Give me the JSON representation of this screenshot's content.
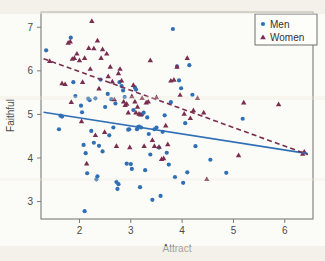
{
  "figure": {
    "background_color": "#fbfbf7",
    "frame_color": "#7b7b7b"
  },
  "legend": {
    "position": "top-right",
    "border_color": "#6f6f6f",
    "entries": [
      {
        "label": "Men",
        "marker": "circle",
        "color": "#2f6fb5"
      },
      {
        "label": "Women",
        "marker": "triangle",
        "color": "#7b2d50"
      }
    ]
  },
  "chart_data": {
    "type": "scatter",
    "title": "",
    "xlabel": "Attract",
    "ylabel": "Faithful",
    "xlim": [
      1.25,
      6.55
    ],
    "ylim": [
      2.6,
      7.35
    ],
    "xticks": [
      2,
      3,
      4,
      5,
      6
    ],
    "yticks": [
      3,
      4,
      5,
      6,
      7
    ],
    "grid": false,
    "legend_position": "top-right",
    "series": [
      {
        "name": "Men",
        "marker": "circle",
        "color": "#2f6fb5",
        "points": [
          [
            1.35,
            6.47
          ],
          [
            1.6,
            4.66
          ],
          [
            1.63,
            4.97
          ],
          [
            1.66,
            4.95
          ],
          [
            1.83,
            6.76
          ],
          [
            1.88,
            5.74
          ],
          [
            1.92,
            5.42
          ],
          [
            2.03,
            5.2
          ],
          [
            2.05,
            5.05
          ],
          [
            2.08,
            4.3
          ],
          [
            2.1,
            2.78
          ],
          [
            2.12,
            4.11
          ],
          [
            2.15,
            3.65
          ],
          [
            2.17,
            5.36
          ],
          [
            2.2,
            5.33
          ],
          [
            2.23,
            4.62
          ],
          [
            2.28,
            4.35
          ],
          [
            2.31,
            5.37
          ],
          [
            2.33,
            3.51
          ],
          [
            2.35,
            3.58
          ],
          [
            2.38,
            4.28
          ],
          [
            2.41,
            5.8
          ],
          [
            2.45,
            4.15
          ],
          [
            2.5,
            5.17
          ],
          [
            2.55,
            5.47
          ],
          [
            2.58,
            4.52
          ],
          [
            2.62,
            5.35
          ],
          [
            2.66,
            4.7
          ],
          [
            2.7,
            5.25
          ],
          [
            2.72,
            3.45
          ],
          [
            2.74,
            3.29
          ],
          [
            2.76,
            3.4
          ],
          [
            2.78,
            5.74
          ],
          [
            2.82,
            5.65
          ],
          [
            2.85,
            5.55
          ],
          [
            2.88,
            5.4
          ],
          [
            2.92,
            3.87
          ],
          [
            2.95,
            4.65
          ],
          [
            2.97,
            4.66
          ],
          [
            3.0,
            3.86
          ],
          [
            3.02,
            3.75
          ],
          [
            3.05,
            5.1
          ],
          [
            3.08,
            5.62
          ],
          [
            3.1,
            5.57
          ],
          [
            3.12,
            4.66
          ],
          [
            3.14,
            4.71
          ],
          [
            3.16,
            4.72
          ],
          [
            3.18,
            3.33
          ],
          [
            3.2,
            4.7
          ],
          [
            3.22,
            5.0
          ],
          [
            3.25,
            5.04
          ],
          [
            3.28,
            3.72
          ],
          [
            3.32,
            4.93
          ],
          [
            3.35,
            4.55
          ],
          [
            3.38,
            4.08
          ],
          [
            3.42,
            3.04
          ],
          [
            3.46,
            4.66
          ],
          [
            3.5,
            4.7
          ],
          [
            3.55,
            4.24
          ],
          [
            3.58,
            3.13
          ],
          [
            3.62,
            4.6
          ],
          [
            3.66,
            4.98
          ],
          [
            3.7,
            4.12
          ],
          [
            3.74,
            3.85
          ],
          [
            3.78,
            5.28
          ],
          [
            3.82,
            6.96
          ],
          [
            3.86,
            3.56
          ],
          [
            3.9,
            6.1
          ],
          [
            3.94,
            5.78
          ],
          [
            3.98,
            5.6
          ],
          [
            4.02,
            3.43
          ],
          [
            4.06,
            4.8
          ],
          [
            4.1,
            3.67
          ],
          [
            4.14,
            6.13
          ],
          [
            4.2,
            5.45
          ],
          [
            4.26,
            4.27
          ],
          [
            4.55,
            3.96
          ],
          [
            4.86,
            3.66
          ],
          [
            5.18,
            4.9
          ]
        ]
      },
      {
        "name": "Women",
        "marker": "triangle",
        "color": "#7b2d50",
        "points": [
          [
            1.42,
            6.23
          ],
          [
            1.66,
            5.72
          ],
          [
            1.72,
            5.7
          ],
          [
            1.78,
            6.65
          ],
          [
            1.82,
            6.68
          ],
          [
            1.84,
            5.29
          ],
          [
            1.86,
            6.28
          ],
          [
            1.9,
            6.3
          ],
          [
            1.95,
            6.4
          ],
          [
            2.0,
            6.25
          ],
          [
            2.04,
            4.85
          ],
          [
            2.06,
            5.75
          ],
          [
            2.1,
            6.3
          ],
          [
            2.14,
            3.88
          ],
          [
            2.18,
            6.53
          ],
          [
            2.21,
            6.05
          ],
          [
            2.24,
            7.15
          ],
          [
            2.28,
            6.52
          ],
          [
            2.31,
            4.53
          ],
          [
            2.35,
            6.7
          ],
          [
            2.38,
            5.6
          ],
          [
            2.42,
            6.3
          ],
          [
            2.45,
            6.5
          ],
          [
            2.49,
            4.6
          ],
          [
            2.53,
            6.4
          ],
          [
            2.56,
            5.88
          ],
          [
            2.6,
            6.1
          ],
          [
            2.64,
            5.76
          ],
          [
            2.68,
            5.35
          ],
          [
            2.72,
            4.28
          ],
          [
            2.76,
            5.95
          ],
          [
            2.79,
            6.05
          ],
          [
            2.82,
            5.78
          ],
          [
            2.86,
            5.3
          ],
          [
            2.89,
            5.22
          ],
          [
            2.92,
            5.25
          ],
          [
            2.95,
            5.05
          ],
          [
            2.98,
            4.25
          ],
          [
            3.02,
            5.42
          ],
          [
            3.05,
            5.68
          ],
          [
            3.08,
            5.3
          ],
          [
            3.1,
            5.05
          ],
          [
            3.13,
            5.18
          ],
          [
            3.16,
            5.02
          ],
          [
            3.19,
            5.0
          ],
          [
            3.22,
            5.38
          ],
          [
            3.26,
            4.28
          ],
          [
            3.3,
            5.28
          ],
          [
            3.34,
            5.3
          ],
          [
            3.38,
            6.25
          ],
          [
            3.42,
            4.42
          ],
          [
            3.46,
            4.28
          ],
          [
            3.5,
            5.4
          ],
          [
            3.55,
            4.26
          ],
          [
            3.6,
            3.98
          ],
          [
            3.64,
            4.0
          ],
          [
            3.68,
            4.75
          ],
          [
            3.72,
            4.32
          ],
          [
            3.78,
            5.78
          ],
          [
            3.84,
            5.8
          ],
          [
            3.9,
            6.1
          ],
          [
            3.96,
            5.45
          ],
          [
            4.04,
            5.02
          ],
          [
            4.1,
            6.3
          ],
          [
            4.16,
            4.92
          ],
          [
            4.22,
            5.1
          ],
          [
            4.3,
            5.38
          ],
          [
            4.42,
            5.05
          ],
          [
            4.48,
            3.52
          ],
          [
            5.1,
            4.07
          ],
          [
            5.2,
            5.28
          ],
          [
            5.88,
            5.24
          ],
          [
            6.35,
            4.1
          ],
          [
            6.38,
            4.15
          ]
        ]
      }
    ],
    "fit_lines": [
      {
        "name": "Men fit",
        "style": "solid",
        "color": "#2f6fb5",
        "x": [
          1.3,
          6.45
        ],
        "y": [
          5.05,
          4.1
        ]
      },
      {
        "name": "Women fit",
        "style": "dashed",
        "color": "#7b2d50",
        "x": [
          1.3,
          6.45
        ],
        "y": [
          6.28,
          4.08
        ]
      }
    ]
  }
}
